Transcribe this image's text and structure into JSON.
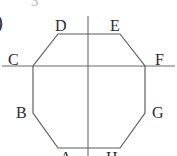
{
  "figure": {
    "name": "regular-octagon-with-axes",
    "background_color": "#ffffff",
    "stroke_color": "#555555",
    "label_color": "#2b2b2b",
    "bleed_color": "#b9b9b9",
    "margin_marker": ")",
    "top_bleed_text": "3",
    "labels": [
      {
        "id": "D",
        "text": "D",
        "x": 55,
        "y": 18
      },
      {
        "id": "E",
        "text": "E",
        "x": 110,
        "y": 18
      },
      {
        "id": "C",
        "text": "C",
        "x": 8,
        "y": 52
      },
      {
        "id": "F",
        "text": "F",
        "x": 155,
        "y": 52
      },
      {
        "id": "B",
        "text": "B",
        "x": 16,
        "y": 105
      },
      {
        "id": "G",
        "text": "G",
        "x": 152,
        "y": 105
      },
      {
        "id": "A",
        "text": "A",
        "x": 60,
        "y": 150
      },
      {
        "id": "H",
        "text": "H",
        "x": 106,
        "y": 150
      }
    ],
    "octagon_vertices": [
      {
        "id": "D-top-left",
        "x": 58,
        "y": 34
      },
      {
        "id": "E-top-right",
        "x": 120,
        "y": 34
      },
      {
        "id": "F-right-upper",
        "x": 145,
        "y": 66
      },
      {
        "id": "G-right-lower",
        "x": 145,
        "y": 113
      },
      {
        "id": "H-bottom-right",
        "x": 120,
        "y": 148
      },
      {
        "id": "A-bottom-left",
        "x": 58,
        "y": 148
      },
      {
        "id": "B-left-lower",
        "x": 33,
        "y": 113
      },
      {
        "id": "C-left-upper",
        "x": 33,
        "y": 66
      }
    ],
    "axes": {
      "horizontal": {
        "x1": 2,
        "y1": 66,
        "x2": 175,
        "y2": 66
      },
      "vertical": {
        "x1": 88,
        "y1": 16,
        "x2": 88,
        "y2": 156
      }
    }
  }
}
